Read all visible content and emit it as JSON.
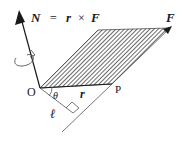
{
  "diagram": {
    "equation": {
      "lhs": "N",
      "eq": "=",
      "r": "r",
      "times": "×",
      "F": "F"
    },
    "labels": {
      "origin": "O",
      "point": "P",
      "force": "F",
      "position": "r",
      "angle": "θ",
      "lever_arm": "ℓ"
    },
    "colors": {
      "line": "#1a1a1a",
      "hatch": "#2a2a2a",
      "background": "#ffffff"
    }
  }
}
